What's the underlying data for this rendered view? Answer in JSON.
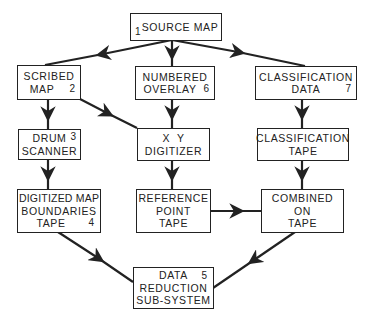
{
  "diagram": {
    "nodes": [
      {
        "id": "source-map",
        "number": "1",
        "lines": [
          "SOURCE MAP"
        ]
      },
      {
        "id": "scribed-map",
        "number": "2",
        "lines": [
          "SCRIBED",
          "MAP"
        ]
      },
      {
        "id": "numbered-overlay",
        "number": "6",
        "lines": [
          "NUMBERED",
          "OVERLAY"
        ]
      },
      {
        "id": "classification-data",
        "number": "7",
        "lines": [
          "CLASSIFICATION",
          "DATA"
        ]
      },
      {
        "id": "drum-scanner",
        "number": "3",
        "lines": [
          "DRUM",
          "SCANNER"
        ]
      },
      {
        "id": "xy-digitizer",
        "number": "",
        "lines": [
          "X  Y",
          "DIGITIZER"
        ]
      },
      {
        "id": "classification-tape",
        "number": "",
        "lines": [
          "CLASSIFICATION",
          "TAPE"
        ]
      },
      {
        "id": "digitized-map-boundaries-tape",
        "number": "4",
        "lines": [
          "DIGITIZED MAP",
          "BOUNDARIES",
          "TAPE"
        ]
      },
      {
        "id": "reference-point-tape",
        "number": "",
        "lines": [
          "REFERENCE",
          "POINT",
          "TAPE"
        ]
      },
      {
        "id": "combined-on-tape",
        "number": "",
        "lines": [
          "COMBINED",
          "ON",
          "TAPE"
        ]
      },
      {
        "id": "data-reduction-sub-system",
        "number": "5",
        "lines": [
          "DATA",
          "REDUCTION",
          "SUB-SYSTEM"
        ]
      }
    ],
    "edges": [
      {
        "from": "source-map",
        "to": "scribed-map"
      },
      {
        "from": "source-map",
        "to": "numbered-overlay"
      },
      {
        "from": "source-map",
        "to": "classification-data"
      },
      {
        "from": "scribed-map",
        "to": "drum-scanner"
      },
      {
        "from": "scribed-map",
        "to": "xy-digitizer"
      },
      {
        "from": "numbered-overlay",
        "to": "xy-digitizer"
      },
      {
        "from": "classification-data",
        "to": "classification-tape"
      },
      {
        "from": "drum-scanner",
        "to": "digitized-map-boundaries-tape"
      },
      {
        "from": "xy-digitizer",
        "to": "reference-point-tape"
      },
      {
        "from": "classification-tape",
        "to": "combined-on-tape"
      },
      {
        "from": "reference-point-tape",
        "to": "combined-on-tape"
      },
      {
        "from": "digitized-map-boundaries-tape",
        "to": "data-reduction-sub-system"
      },
      {
        "from": "combined-on-tape",
        "to": "data-reduction-sub-system"
      }
    ]
  }
}
